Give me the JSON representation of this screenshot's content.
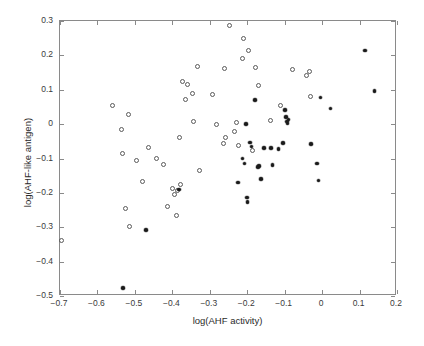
{
  "chart_data": {
    "type": "scatter",
    "title": "",
    "xlabel": "log(AHF activity)",
    "ylabel": "log(AHF-like antigen)",
    "xlim": [
      -0.7,
      0.2
    ],
    "ylim": [
      -0.5,
      0.3
    ],
    "xticks": [
      -0.7,
      -0.6,
      -0.5,
      -0.4,
      -0.3,
      -0.2,
      -0.1,
      0,
      0.1,
      0.2
    ],
    "xticklabels": [
      "-0.7",
      "-0.6",
      "-0.5",
      "-0.4",
      "-0.3",
      "-0.2",
      "-0.1",
      "0",
      "0.1",
      "0.2"
    ],
    "yticks": [
      0.3,
      0.2,
      0.1,
      0,
      -0.1,
      -0.2,
      -0.3,
      -0.4,
      -0.5
    ],
    "yticklabels": [
      "0.3",
      "0.2",
      "0.1",
      "0",
      "-0.1",
      "-0.2",
      "-0.3",
      "-0.4",
      "-0.5"
    ],
    "grid": false,
    "legend": null,
    "marker_colors": {
      "open": "#5a5a5a",
      "filled": "#1a1a1a"
    },
    "series": [
      {
        "name": "open-circles",
        "marker": "open-circle",
        "points": [
          [
            -0.697,
            -0.339
          ],
          [
            -0.56,
            0.054
          ],
          [
            -0.525,
            -0.245
          ],
          [
            -0.518,
            0.028
          ],
          [
            -0.515,
            -0.298
          ],
          [
            -0.533,
            -0.086
          ],
          [
            -0.537,
            -0.015
          ],
          [
            -0.495,
            -0.107
          ],
          [
            -0.481,
            -0.168
          ],
          [
            -0.463,
            -0.069
          ],
          [
            -0.442,
            -0.1
          ],
          [
            -0.424,
            -0.116
          ],
          [
            -0.413,
            -0.241
          ],
          [
            -0.399,
            -0.188
          ],
          [
            -0.394,
            -0.205
          ],
          [
            -0.39,
            -0.267
          ],
          [
            -0.385,
            -0.192
          ],
          [
            -0.378,
            -0.176
          ],
          [
            -0.381,
            -0.038
          ],
          [
            -0.372,
            0.125
          ],
          [
            -0.366,
            0.072
          ],
          [
            -0.36,
            0.116
          ],
          [
            -0.347,
            0.088
          ],
          [
            -0.343,
            0.008
          ],
          [
            -0.334,
            0.167
          ],
          [
            -0.328,
            -0.136
          ],
          [
            -0.293,
            0.086
          ],
          [
            -0.282,
            -0.001
          ],
          [
            -0.264,
            -0.056
          ],
          [
            -0.261,
            0.163
          ],
          [
            -0.258,
            -0.04
          ],
          [
            -0.248,
            0.286
          ],
          [
            -0.234,
            -0.021
          ],
          [
            -0.228,
            0.005
          ],
          [
            -0.222,
            -0.062
          ],
          [
            -0.213,
            0.19
          ],
          [
            -0.209,
            0.25
          ],
          [
            -0.197,
            0.213
          ],
          [
            -0.186,
            -0.076
          ],
          [
            -0.178,
            0.165
          ],
          [
            -0.17,
            0.113
          ],
          [
            -0.137,
            0.01
          ],
          [
            -0.112,
            0.054
          ],
          [
            -0.079,
            0.158
          ],
          [
            -0.041,
            0.141
          ],
          [
            -0.035,
            0.154
          ],
          [
            -0.032,
            0.081
          ]
        ]
      },
      {
        "name": "filled-dots",
        "marker": "filled-dot",
        "points": [
          [
            -0.531,
            -0.477
          ],
          [
            -0.47,
            -0.308
          ],
          [
            -0.382,
            -0.19
          ],
          [
            -0.224,
            -0.17
          ],
          [
            -0.213,
            -0.1
          ],
          [
            -0.207,
            -0.115
          ],
          [
            -0.203,
            0.0
          ],
          [
            -0.2,
            -0.213
          ],
          [
            -0.199,
            -0.227
          ],
          [
            -0.192,
            -0.053
          ],
          [
            -0.189,
            -0.065
          ],
          [
            -0.18,
            0.071
          ],
          [
            -0.172,
            -0.125
          ],
          [
            -0.168,
            -0.122
          ],
          [
            -0.163,
            -0.159
          ],
          [
            -0.155,
            -0.069
          ],
          [
            -0.136,
            -0.069
          ],
          [
            -0.132,
            -0.119
          ],
          [
            -0.116,
            -0.073
          ],
          [
            -0.105,
            -0.055
          ],
          [
            -0.099,
            0.041
          ],
          [
            -0.096,
            0.021
          ],
          [
            -0.093,
            0.008
          ],
          [
            -0.092,
            0.002
          ],
          [
            -0.09,
            0.014
          ],
          [
            -0.03,
            -0.057
          ],
          [
            -0.013,
            -0.115
          ],
          [
            -0.01,
            -0.164
          ],
          [
            -0.004,
            0.078
          ],
          [
            0.022,
            0.045
          ],
          [
            0.114,
            0.214
          ],
          [
            0.14,
            0.096
          ]
        ]
      }
    ]
  },
  "axis": {
    "xlabel_text": "log(AHF activity)",
    "ylabel_text": "log(AHF-like antigen)"
  }
}
